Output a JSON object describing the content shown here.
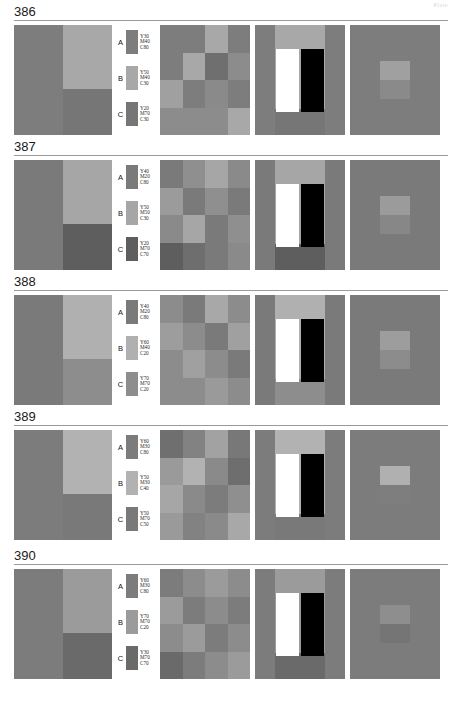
{
  "header": {
    "corner_note": "Plate"
  },
  "plates": [
    {
      "number": "386",
      "legend": [
        {
          "letter": "A",
          "y": "Y30",
          "m": "M40",
          "c": "C80",
          "color": "#7d7d7d"
        },
        {
          "letter": "B",
          "y": "Y50",
          "m": "M40",
          "c": "C30",
          "color": "#a8a8a8"
        },
        {
          "letter": "C",
          "y": "Y20",
          "m": "M70",
          "c": "C30",
          "color": "#767676"
        }
      ],
      "panel1": {
        "left": "#7d7d7d",
        "right_top": "#a8a8a8",
        "right_bottom": "#767676"
      },
      "panel2": [
        "#7d7d7d",
        "#7d7d7d",
        "#a8a8a8",
        "#7d7d7d",
        "#7d7d7d",
        "#a8a8a8",
        "#6f6f6f",
        "#8c8c8c",
        "#a0a0a0",
        "#7d7d7d",
        "#8a8a8a",
        "#7d7d7d",
        "#8c8c8c",
        "#8c8c8c",
        "#8c8c8c",
        "#a8a8a8"
      ],
      "panel3": {
        "base": "#7d7d7d",
        "band": "#a8a8a8",
        "bottom": "#767676"
      },
      "panel4": {
        "base": "#7d7d7d",
        "square_top": "#a0a0a0",
        "square_bottom": "#8a8a8a"
      }
    },
    {
      "number": "387",
      "legend": [
        {
          "letter": "A",
          "y": "Y40",
          "m": "M20",
          "c": "C80",
          "color": "#7a7a7a"
        },
        {
          "letter": "B",
          "y": "Y50",
          "m": "M50",
          "c": "C30",
          "color": "#a6a6a6"
        },
        {
          "letter": "C",
          "y": "Y20",
          "m": "M70",
          "c": "C70",
          "color": "#5e5e5e"
        }
      ],
      "panel1": {
        "left": "#7a7a7a",
        "right_top": "#a6a6a6",
        "right_bottom": "#5e5e5e"
      },
      "panel2": [
        "#7a7a7a",
        "#8f8f8f",
        "#a6a6a6",
        "#8a8a8a",
        "#9b9b9b",
        "#7a7a7a",
        "#8f8f8f",
        "#7a7a7a",
        "#8a8a8a",
        "#a6a6a6",
        "#7a7a7a",
        "#8f8f8f",
        "#5e5e5e",
        "#6e6e6e",
        "#7a7a7a",
        "#8a8a8a"
      ],
      "panel3": {
        "base": "#7a7a7a",
        "band": "#a6a6a6",
        "bottom": "#5e5e5e"
      },
      "panel4": {
        "base": "#7a7a7a",
        "square_top": "#9b9b9b",
        "square_bottom": "#878787"
      }
    },
    {
      "number": "388",
      "legend": [
        {
          "letter": "A",
          "y": "Y40",
          "m": "M20",
          "c": "C80",
          "color": "#7a7a7a"
        },
        {
          "letter": "B",
          "y": "Y60",
          "m": "M40",
          "c": "C20",
          "color": "#b0b0b0"
        },
        {
          "letter": "C",
          "y": "Y70",
          "m": "M70",
          "c": "C20",
          "color": "#8d8d8d"
        }
      ],
      "panel1": {
        "left": "#7a7a7a",
        "right_top": "#b0b0b0",
        "right_bottom": "#8d8d8d"
      },
      "panel2": [
        "#8c8c8c",
        "#7a7a7a",
        "#a8a8a8",
        "#8c8c8c",
        "#9d9d9d",
        "#8c8c8c",
        "#7a7a7a",
        "#a0a0a0",
        "#8c8c8c",
        "#a0a0a0",
        "#8c8c8c",
        "#7a7a7a",
        "#8c8c8c",
        "#8c8c8c",
        "#9a9a9a",
        "#8c8c8c"
      ],
      "panel3": {
        "base": "#7a7a7a",
        "band": "#b0b0b0",
        "bottom": "#8d8d8d"
      },
      "panel4": {
        "base": "#7a7a7a",
        "square_top": "#9d9d9d",
        "square_bottom": "#8c8c8c"
      }
    },
    {
      "number": "389",
      "legend": [
        {
          "letter": "A",
          "y": "Y60",
          "m": "M30",
          "c": "C80",
          "color": "#7c7c7c"
        },
        {
          "letter": "B",
          "y": "Y50",
          "m": "M30",
          "c": "C40",
          "color": "#b2b2b2"
        },
        {
          "letter": "C",
          "y": "Y50",
          "m": "M70",
          "c": "C50",
          "color": "#797979"
        }
      ],
      "panel1": {
        "left": "#7c7c7c",
        "right_top": "#b2b2b2",
        "right_bottom": "#797979"
      },
      "panel2": [
        "#6f6f6f",
        "#828282",
        "#a2a2a2",
        "#787878",
        "#9a9a9a",
        "#b2b2b2",
        "#8a8a8a",
        "#6e6e6e",
        "#a6a6a6",
        "#8a8a8a",
        "#7c7c7c",
        "#8f8f8f",
        "#9a9a9a",
        "#828282",
        "#8a8a8a",
        "#a8a8a8"
      ],
      "panel3": {
        "base": "#7c7c7c",
        "band": "#b2b2b2",
        "bottom": "#797979"
      },
      "panel4": {
        "base": "#7c7c7c",
        "square_top": "#b0b0b0",
        "square_bottom": "#7e7e7e"
      }
    },
    {
      "number": "390",
      "legend": [
        {
          "letter": "A",
          "y": "Y60",
          "m": "M30",
          "c": "C80",
          "color": "#7c7c7c"
        },
        {
          "letter": "B",
          "y": "Y70",
          "m": "M70",
          "c": "C20",
          "color": "#9b9b9b"
        },
        {
          "letter": "C",
          "y": "Y30",
          "m": "M70",
          "c": "C70",
          "color": "#6a6a6a"
        }
      ],
      "panel1": {
        "left": "#7c7c7c",
        "right_top": "#9b9b9b",
        "right_bottom": "#6a6a6a"
      },
      "panel2": [
        "#7c7c7c",
        "#8c8c8c",
        "#9b9b9b",
        "#8c8c8c",
        "#9b9b9b",
        "#7c7c7c",
        "#8c8c8c",
        "#7c7c7c",
        "#8c8c8c",
        "#9b9b9b",
        "#7c7c7c",
        "#8c8c8c",
        "#6a6a6a",
        "#7c7c7c",
        "#8c8c8c",
        "#9b9b9b"
      ],
      "panel3": {
        "base": "#7c7c7c",
        "band": "#9b9b9b",
        "bottom": "#6a6a6a"
      },
      "panel4": {
        "base": "#7c7c7c",
        "square_top": "#8e8e8e",
        "square_bottom": "#757575"
      }
    }
  ]
}
